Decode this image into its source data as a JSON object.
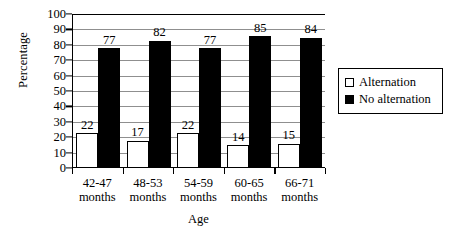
{
  "chart_data": {
    "type": "bar",
    "title": "",
    "subtitle": "",
    "xlabel": "Age",
    "ylabel": "Percentage",
    "ylim": [
      0,
      100
    ],
    "ytick_step": 10,
    "yticks": [
      100,
      90,
      80,
      70,
      60,
      50,
      40,
      30,
      20,
      10,
      0
    ],
    "grid": true,
    "grid_axis": "y",
    "legend_position": "right",
    "categories": [
      "42-47 months",
      "48-53 months",
      "54-59 months",
      "60-65 months",
      "66-71 months"
    ],
    "category_lines": [
      [
        "42-47",
        "months"
      ],
      [
        "48-53",
        "months"
      ],
      [
        "54-59",
        "months"
      ],
      [
        "60-65",
        "months"
      ],
      [
        "66-71",
        "months"
      ]
    ],
    "series": [
      {
        "name": "Alternation",
        "color": "#ffffff",
        "edge_color": "#000000",
        "values": [
          22,
          17,
          22,
          14,
          15
        ]
      },
      {
        "name": "No alternation",
        "color": "#000000",
        "edge_color": "#000000",
        "values": [
          77,
          82,
          77,
          85,
          84
        ]
      }
    ],
    "data_labels": true,
    "axis_color": "#000000",
    "gridline_color": "#8f8f8f",
    "background": "#ffffff"
  },
  "legend": {
    "items": [
      {
        "label": "Alternation",
        "swatch": "open-square-swatch"
      },
      {
        "label": "No alternation",
        "swatch": "filled-square-swatch"
      }
    ]
  }
}
